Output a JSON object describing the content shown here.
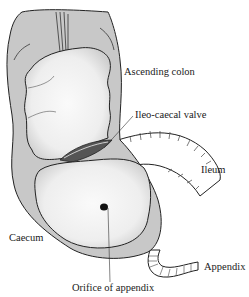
{
  "diagram": {
    "labels": {
      "ascending_colon": "Ascending colon",
      "ileo_caecal_valve": "Ileo-caecal valve",
      "ileum": "Ileum",
      "caecum": "Caecum",
      "appendix": "Appendix",
      "orifice_of_appendix": "Orifice of appendix"
    },
    "colors": {
      "wall": "#c8c8c8",
      "lumen": "#f4f4f4",
      "outline": "#222222",
      "leader": "#333333"
    }
  }
}
